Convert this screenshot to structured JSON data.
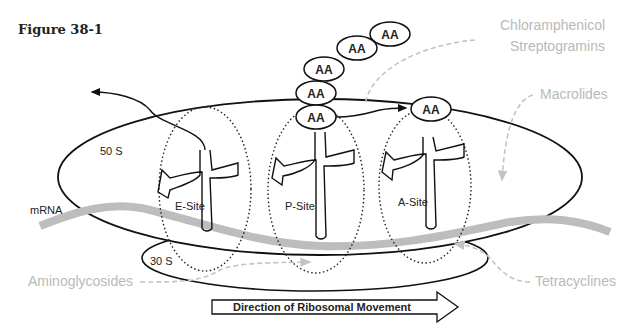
{
  "figure": {
    "title": "Figure 38-1"
  },
  "ribosome": {
    "large_subunit_label": "50 S",
    "small_subunit_label": "30 S",
    "mrna_label": "mRNA",
    "sites": [
      {
        "label": "E-Site"
      },
      {
        "label": "P-Site"
      },
      {
        "label": "A-Site"
      }
    ]
  },
  "peptide_chain": {
    "amino_acid_label": "AA",
    "count_on_p_site_chain": 5,
    "count_on_a_site": 1
  },
  "antibiotics": {
    "chloramphenicol": "Chloramphenicol",
    "streptogramins": "Streptogramins",
    "macrolides": "Macrolides",
    "aminoglycosides": "Aminoglycosides",
    "tetracyclines": "Tetracyclines"
  },
  "direction_arrow": {
    "label": "Direction of Ribosomal Movement"
  },
  "colors": {
    "outline": "#111111",
    "mrna": "#bdbdbd",
    "drug_label": "#b9b9b9",
    "drug_arrow": "#c4c4c4"
  }
}
